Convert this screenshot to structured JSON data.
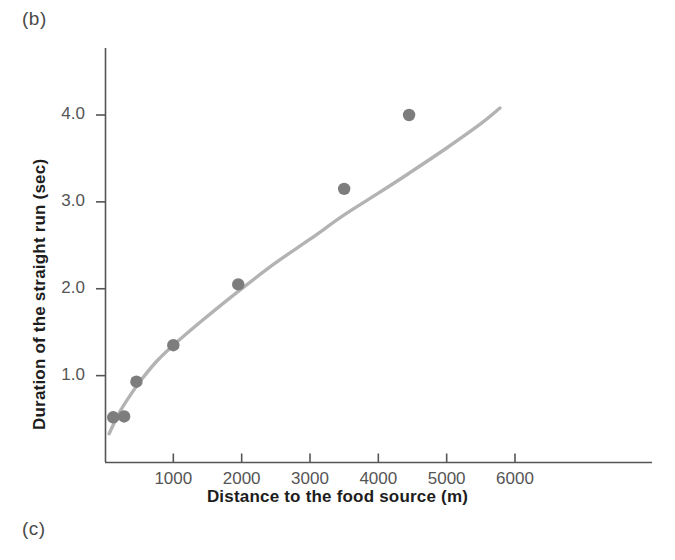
{
  "figure": {
    "panel_label_b": "(b)",
    "panel_label_c": "(c)"
  },
  "chart_data": {
    "type": "scatter",
    "title": "",
    "xlabel": "Distance to the food source (m)",
    "ylabel": "Duration of the straight run (sec)",
    "xlim": [
      0,
      6700
    ],
    "ylim": [
      0,
      4.75
    ],
    "grid": false,
    "legend": "none",
    "xticks": [
      1000,
      2000,
      3000,
      4000,
      5000,
      6000
    ],
    "xtick_labels": [
      "1000",
      "2000",
      "3000",
      "4000",
      "5000",
      "6000"
    ],
    "yticks": [
      1.0,
      2.0,
      3.0,
      4.0
    ],
    "ytick_labels": [
      "1.0",
      "2.0",
      "3.0",
      "4.0"
    ],
    "marker_color": "#7d7d7d",
    "line_color": "#b3b3b3",
    "axis_color": "#555555",
    "points": [
      {
        "x": 120,
        "y": 0.52
      },
      {
        "x": 280,
        "y": 0.53
      },
      {
        "x": 460,
        "y": 0.93
      },
      {
        "x": 1000,
        "y": 1.35
      },
      {
        "x": 1950,
        "y": 2.05
      },
      {
        "x": 3500,
        "y": 3.15
      },
      {
        "x": 4450,
        "y": 4.0
      }
    ],
    "fit_curve": {
      "name": "fitted curve",
      "x": [
        60,
        200,
        350,
        520,
        750,
        1000,
        1400,
        1950,
        2500,
        3000,
        3500,
        4000,
        4450,
        5000,
        5500,
        5780
      ],
      "y": [
        0.33,
        0.56,
        0.75,
        0.94,
        1.16,
        1.35,
        1.62,
        1.97,
        2.3,
        2.57,
        2.85,
        3.1,
        3.33,
        3.62,
        3.9,
        4.08
      ]
    }
  }
}
